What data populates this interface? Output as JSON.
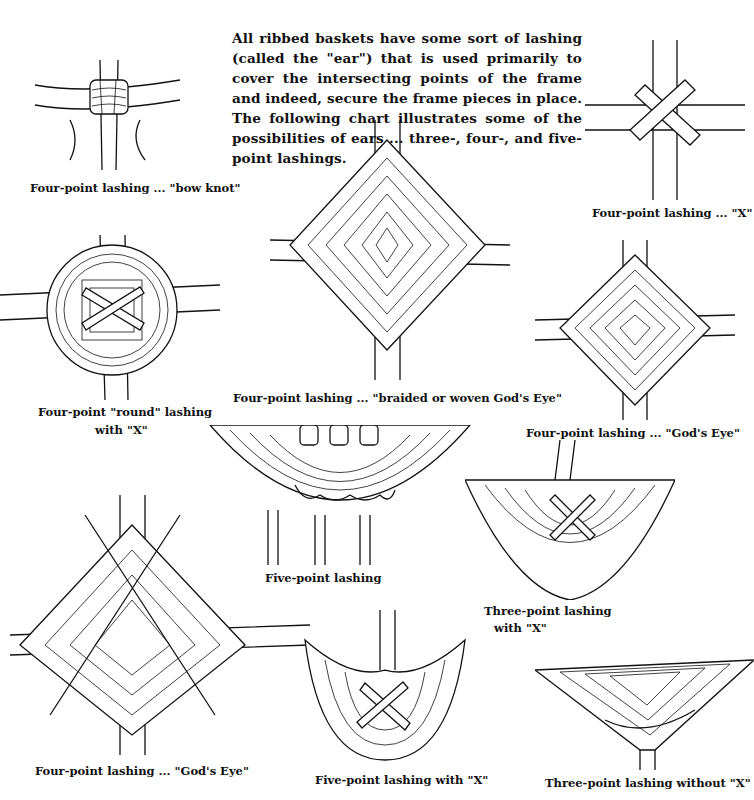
{
  "intro_text": "All ribbed baskets have some sort of lashing (called the \"ear\") that is used primarily to cover the intersecting points of the frame and indeed, secure the frame pieces in place. The following chart illustrates some of the possibilities of ears ... three-, four-, and five-point lashings.",
  "figures": [
    {
      "id": "bow-knot",
      "caption": "Four-point lashing ... \"bow knot\""
    },
    {
      "id": "x",
      "caption": "Four-point lashing ... \"X\""
    },
    {
      "id": "round-x",
      "caption_line1": "Four-point \"round\" lashing",
      "caption_line2": "with \"X\""
    },
    {
      "id": "braided-gods-eye",
      "caption": "Four-point lashing ... \"braided or woven God's Eye\""
    },
    {
      "id": "gods-eye-small",
      "caption": "Four-point lashing ... \"God's Eye\""
    },
    {
      "id": "five-point",
      "caption": "Five-point lashing"
    },
    {
      "id": "three-point-x",
      "caption_line1": "Three-point lashing",
      "caption_line2": "with \"X\""
    },
    {
      "id": "gods-eye-large",
      "caption": "Four-point lashing ... \"God's Eye\""
    },
    {
      "id": "five-point-x",
      "caption": "Five-point lashing with \"X\""
    },
    {
      "id": "three-point-no-x",
      "caption": "Three-point lashing without \"X\""
    }
  ]
}
